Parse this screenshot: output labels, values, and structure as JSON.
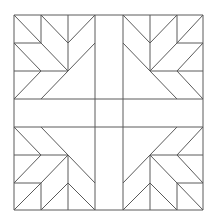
{
  "diagram": {
    "type": "quilt-block-line-drawing",
    "title": "",
    "background": "#ffffff",
    "stroke_color": "#5a5a5a",
    "grid": {
      "columns": 7,
      "rows": 7,
      "x": [
        14,
        41,
        68,
        95,
        123,
        150,
        177,
        203
      ],
      "y": [
        15,
        43,
        71,
        99,
        127,
        155,
        183,
        210
      ]
    },
    "quadrants": [
      "top-left",
      "top-right",
      "bottom-left",
      "bottom-right"
    ],
    "motif": "feather / tree-of-life chevron in each corner quadrant, mirrored, separated by a center cross band"
  }
}
